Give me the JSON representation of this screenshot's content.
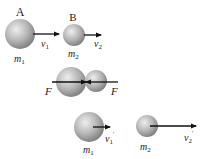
{
  "colors": {
    "ball": "#a8a8a8",
    "ball_highlight": "#e6e6e6",
    "arrow": "#111111",
    "text": "#222222"
  },
  "stage1": {
    "ball_a": {
      "label": "A",
      "mass": "m",
      "mass_sub": "1",
      "velocity": "v",
      "velocity_sub": "1"
    },
    "ball_b": {
      "label": "B",
      "mass": "m",
      "mass_sub": "2",
      "velocity": "v",
      "velocity_sub": "2"
    }
  },
  "stage2": {
    "force_left": "F",
    "force_right": "F"
  },
  "stage3": {
    "ball_1": {
      "mass": "m",
      "mass_sub": "1",
      "velocity": "v",
      "velocity_sub": "1",
      "prime": "'"
    },
    "ball_2": {
      "mass": "m",
      "mass_sub": "2",
      "velocity": "v",
      "velocity_sub": "2",
      "prime": "'"
    }
  }
}
